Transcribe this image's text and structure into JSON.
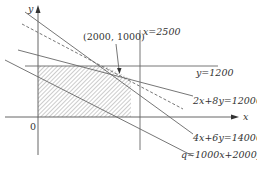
{
  "diagram": {
    "type": "linear-programming-feasible-region",
    "axes": {
      "x_label": "x",
      "y_label": "y",
      "origin_label": "0"
    },
    "constraints": [
      {
        "id": "x-2500",
        "label": "x=2500"
      },
      {
        "id": "y-1200",
        "label": "y=1200"
      },
      {
        "id": "2x8y",
        "label": "2x+8y=12000"
      },
      {
        "id": "4x6y",
        "label": "4x+6y=14000"
      }
    ],
    "objective": {
      "label": "q=1000x+2000y",
      "style": "dashed"
    },
    "optimal_point": {
      "label": "(2000, 1000)"
    },
    "feasible_region": {
      "fill": "hatched"
    },
    "colors": {
      "line": "#666666",
      "axis": "#555555",
      "hatch": "#9a9a9a"
    }
  }
}
